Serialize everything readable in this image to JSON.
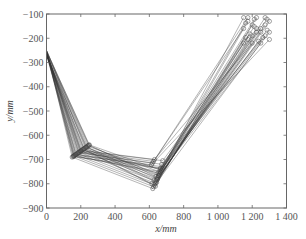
{
  "chart_data": {
    "type": "line",
    "title": "",
    "xlabel": "x/mm",
    "ylabel": "y/mm",
    "xlim": [
      0,
      1400
    ],
    "ylim": [
      -900,
      -100
    ],
    "xticks": [
      0,
      200,
      400,
      600,
      800,
      1000,
      1200,
      1400
    ],
    "xtick_labels": [
      "0",
      "200",
      "400",
      "600",
      "800",
      "1 000",
      "1 200",
      "1 400"
    ],
    "yticks": [
      -100,
      -200,
      -300,
      -400,
      -500,
      -600,
      -700,
      -800,
      -900
    ],
    "ytick_labels": [
      "-100",
      "-200",
      "-300",
      "-400",
      "-500",
      "-600",
      "-700",
      "-800",
      "-900"
    ],
    "grid": false,
    "legend": null,
    "marker": "circle-open",
    "line_color": "#333333",
    "series": [
      {
        "name": "path-1",
        "x": [
          0,
          150,
          620,
          1150
        ],
        "y": [
          -250,
          -690,
          -820,
          -220
        ]
      },
      {
        "name": "path-2",
        "x": [
          0,
          160,
          625,
          1175
        ],
        "y": [
          -252,
          -685,
          -812,
          -205
        ]
      },
      {
        "name": "path-3",
        "x": [
          0,
          170,
          630,
          1200
        ],
        "y": [
          -255,
          -680,
          -805,
          -190
        ]
      },
      {
        "name": "path-4",
        "x": [
          0,
          180,
          635,
          1225
        ],
        "y": [
          -258,
          -675,
          -798,
          -175
        ]
      },
      {
        "name": "path-5",
        "x": [
          0,
          190,
          640,
          1250
        ],
        "y": [
          -260,
          -670,
          -790,
          -160
        ]
      },
      {
        "name": "path-6",
        "x": [
          0,
          200,
          645,
          1275
        ],
        "y": [
          -262,
          -665,
          -782,
          -145
        ]
      },
      {
        "name": "path-7",
        "x": [
          0,
          210,
          650,
          1300
        ],
        "y": [
          -265,
          -660,
          -775,
          -130
        ]
      },
      {
        "name": "path-8",
        "x": [
          0,
          220,
          655,
          1150
        ],
        "y": [
          -268,
          -655,
          -768,
          -115
        ]
      },
      {
        "name": "path-9",
        "x": [
          0,
          230,
          660,
          1175
        ],
        "y": [
          -270,
          -650,
          -760,
          -130
        ]
      },
      {
        "name": "path-10",
        "x": [
          0,
          240,
          665,
          1200
        ],
        "y": [
          -250,
          -645,
          -752,
          -145
        ]
      },
      {
        "name": "path-11",
        "x": [
          0,
          250,
          670,
          1225
        ],
        "y": [
          -252,
          -640,
          -745,
          -160
        ]
      },
      {
        "name": "path-12",
        "x": [
          0,
          155,
          675,
          1250
        ],
        "y": [
          -255,
          -688,
          -738,
          -175
        ]
      },
      {
        "name": "path-13",
        "x": [
          0,
          165,
          680,
          1275
        ],
        "y": [
          -258,
          -682,
          -730,
          -190
        ]
      },
      {
        "name": "path-14",
        "x": [
          0,
          175,
          612,
          1300
        ],
        "y": [
          -260,
          -678,
          -722,
          -205
        ]
      },
      {
        "name": "path-15",
        "x": [
          0,
          185,
          618,
          1150
        ],
        "y": [
          -262,
          -672,
          -715,
          -160
        ]
      },
      {
        "name": "path-16",
        "x": [
          0,
          195,
          624,
          1175
        ],
        "y": [
          -265,
          -668,
          -708,
          -115
        ]
      },
      {
        "name": "path-17",
        "x": [
          0,
          205,
          630,
          1200
        ],
        "y": [
          -268,
          -662,
          -700,
          -220
        ]
      },
      {
        "name": "path-18",
        "x": [
          0,
          215,
          636,
          1225
        ],
        "y": [
          -270,
          -658,
          -810,
          -115
        ]
      },
      {
        "name": "path-19",
        "x": [
          0,
          225,
          642,
          1250
        ],
        "y": [
          -250,
          -652,
          -795,
          -220
        ]
      },
      {
        "name": "path-20",
        "x": [
          0,
          235,
          648,
          1275
        ],
        "y": [
          -255,
          -648,
          -780,
          -115
        ]
      },
      {
        "name": "path-21",
        "x": [
          0,
          245,
          654,
          1300
        ],
        "y": [
          -260,
          -642,
          -765,
          -175
        ]
      },
      {
        "name": "path-22",
        "x": [
          0,
          158,
          660,
          1162
        ],
        "y": [
          -265,
          -686,
          -750,
          -137
        ]
      },
      {
        "name": "path-23",
        "x": [
          0,
          172,
          666,
          1212
        ],
        "y": [
          -270,
          -679,
          -735,
          -152
        ]
      },
      {
        "name": "path-24",
        "x": [
          0,
          188,
          672,
          1262
        ],
        "y": [
          -253,
          -671,
          -720,
          -197
        ]
      },
      {
        "name": "path-25",
        "x": [
          0,
          202,
          678,
          1287
        ],
        "y": [
          -257,
          -664,
          -705,
          -122
        ]
      },
      {
        "name": "path-26",
        "x": [
          0,
          218,
          615,
          1187
        ],
        "y": [
          -263,
          -656,
          -800,
          -182
        ]
      },
      {
        "name": "path-27",
        "x": [
          0,
          232,
          627,
          1237
        ],
        "y": [
          -267,
          -649,
          -785,
          -212
        ]
      },
      {
        "name": "path-28",
        "x": [
          0,
          248,
          639,
          1162
        ],
        "y": [
          -251,
          -641,
          -770,
          -197
        ]
      },
      {
        "name": "path-29",
        "x": [
          0,
          163,
          651,
          1212
        ],
        "y": [
          -259,
          -684,
          -755,
          -122
        ]
      },
      {
        "name": "path-30",
        "x": [
          0,
          197,
          663,
          1287
        ],
        "y": [
          -264,
          -666,
          -740,
          -167
        ]
      }
    ]
  }
}
